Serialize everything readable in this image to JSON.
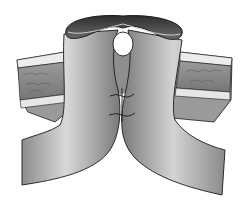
{
  "image": {
    "subject": "surgical illustration of double-barrel stoma (loop of bowel brought through abdominal wall, limbs sutured together)",
    "style": "grayscale line illustration",
    "colors": {
      "background": "#ffffff",
      "bowel_light": "#d8d8d8",
      "bowel_mid": "#a8a8a8",
      "bowel_dark": "#6e6e6e",
      "lumen": "#4a4a4a",
      "wall_tissue": "#8a8a8a",
      "wall_band": "#e6e6e6",
      "outline": "#1a1a1a"
    }
  }
}
